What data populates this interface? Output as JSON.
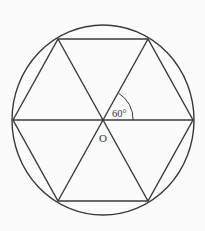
{
  "diagram": {
    "center_label": "O",
    "angle_label": "60°",
    "center": {
      "x": 103,
      "y": 120
    },
    "circle": {
      "cx": 103,
      "cy": 120,
      "rx": 91,
      "ry": 95
    },
    "hexagon_vertices": [
      {
        "x": 13,
        "y": 120
      },
      {
        "x": 58,
        "y": 39
      },
      {
        "x": 148,
        "y": 39
      },
      {
        "x": 193,
        "y": 120
      },
      {
        "x": 148,
        "y": 201
      },
      {
        "x": 58,
        "y": 201
      }
    ],
    "diagonals": [
      {
        "from": "left",
        "to": "right"
      },
      {
        "from": "top-left",
        "to": "bottom-right"
      },
      {
        "from": "top-right",
        "to": "bottom-left"
      }
    ],
    "colors": {
      "stroke": "#3a3a3a",
      "background": "#fbfbfb"
    }
  }
}
